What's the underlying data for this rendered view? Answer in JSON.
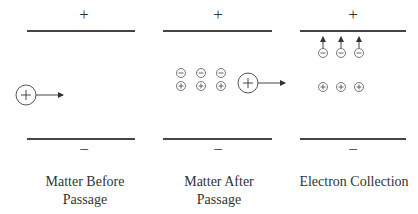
{
  "panels": [
    {
      "title_line1": "Matter Before",
      "title_line2": "Passage",
      "top_sign": "+",
      "bottom_sign": "−"
    },
    {
      "title_line1": "Matter After",
      "title_line2": "Passage",
      "top_sign": "+",
      "bottom_sign": "−"
    },
    {
      "title_line1": "Electron Collection",
      "title_line2": "",
      "top_sign": "+",
      "bottom_sign": "−"
    }
  ],
  "colors": {
    "plate": "#444444",
    "stroke": "#555555",
    "text": "#333333"
  }
}
